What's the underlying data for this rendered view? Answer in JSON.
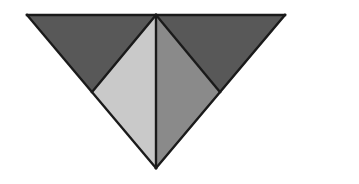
{
  "figure": {
    "canvas": {
      "width": 359,
      "height": 184,
      "background_color": "#ffffff"
    },
    "stroke": {
      "color": "#1a1a1a",
      "width": 2.4
    },
    "vertices": {
      "top_left": {
        "x": 27,
        "y": 15
      },
      "top_apex": {
        "x": 156,
        "y": 15
      },
      "top_right": {
        "x": 285,
        "y": 15
      },
      "bottom_point": {
        "x": 156,
        "y": 168
      },
      "left_mid": {
        "x": 92,
        "y": 92
      },
      "right_mid": {
        "x": 220,
        "y": 92
      }
    },
    "regions": [
      {
        "name": "upper-left-triangle",
        "label": "Upper left triangle",
        "fill_color": "#585858",
        "points": "27,15 156,15 92,92"
      },
      {
        "name": "upper-right-triangle",
        "label": "Upper right triangle",
        "fill_color": "#585858",
        "points": "156,15 285,15 220,92"
      },
      {
        "name": "lower-left-triangle",
        "label": "Lower left triangle",
        "fill_color": "#c9c9c9",
        "points": "92,92 156,15 156,168"
      },
      {
        "name": "lower-right-triangle",
        "label": "Lower right triangle",
        "fill_color": "#8a8a8a",
        "points": "156,15 220,92 156,168"
      }
    ],
    "edges": [
      {
        "name": "top-edge",
        "points": "27,15 285,15"
      },
      {
        "name": "left-hypotenuse",
        "points": "27,15 156,168"
      },
      {
        "name": "right-hypotenuse",
        "points": "285,15 156,168"
      },
      {
        "name": "center-vertical",
        "points": "156,15 156,168"
      },
      {
        "name": "left-diagonal",
        "points": "156,15 92,92"
      },
      {
        "name": "right-diagonal",
        "points": "156,15 220,92"
      }
    ]
  }
}
